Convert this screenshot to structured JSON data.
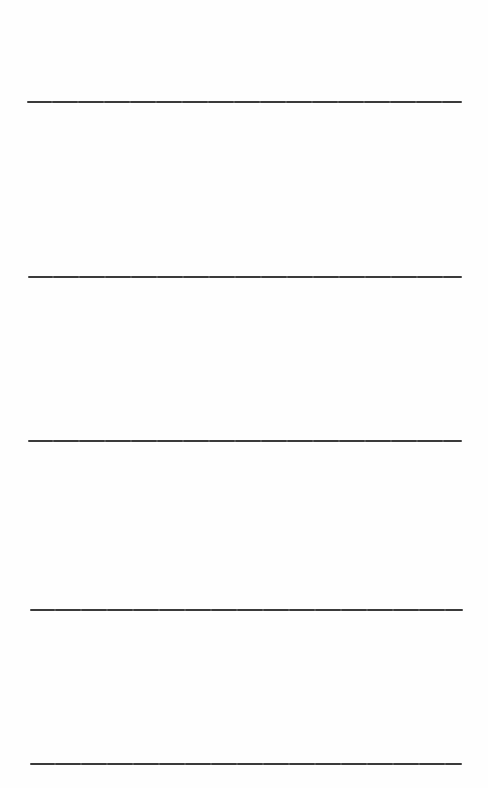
{
  "page": {
    "type": "ruled-blank-form",
    "background_color": "#fefefe",
    "line_color": "#3c3c3c"
  },
  "rules": [
    {
      "index": 1,
      "top": 101,
      "left": 27,
      "width": 435
    },
    {
      "index": 2,
      "top": 276,
      "left": 28,
      "width": 434
    },
    {
      "index": 3,
      "top": 440,
      "left": 28,
      "width": 434
    },
    {
      "index": 4,
      "top": 609,
      "left": 30,
      "width": 433
    },
    {
      "index": 5,
      "top": 763,
      "left": 30,
      "width": 432
    }
  ],
  "fields": [
    {
      "index": 1,
      "value": ""
    },
    {
      "index": 2,
      "value": ""
    },
    {
      "index": 3,
      "value": ""
    },
    {
      "index": 4,
      "value": ""
    },
    {
      "index": 5,
      "value": ""
    }
  ]
}
